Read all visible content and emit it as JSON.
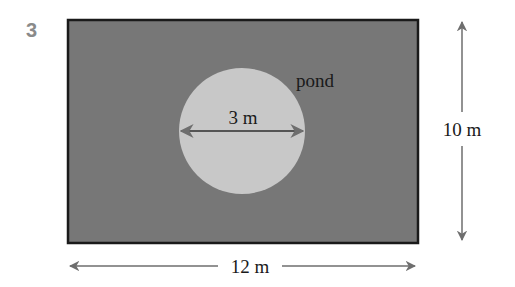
{
  "question_number": "3",
  "figure": {
    "shape": "rectangle",
    "width_label": "12 m",
    "height_label": "10 m",
    "inner_shape": "circle",
    "inner_label": "pond",
    "diameter_label": "3 m",
    "colors": {
      "rectangle_fill": "#777777",
      "rectangle_border": "#1a1a1a",
      "pond_fill": "#c8c8c8",
      "arrow": "#6e6e6e",
      "question_number": "#8a8a8a"
    }
  }
}
